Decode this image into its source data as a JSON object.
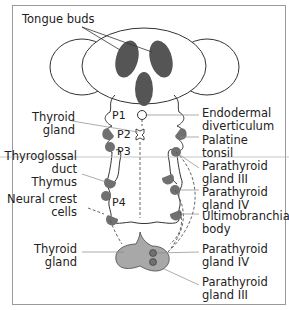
{
  "diagram": {
    "title_label": "Tongue buds",
    "pouches": [
      "P1",
      "P2",
      "P3",
      "P4"
    ],
    "left_labels": [
      {
        "lines": [
          "Thyroid",
          "gland"
        ]
      },
      {
        "lines": [
          "Thyroglossal",
          "duct"
        ]
      },
      {
        "lines": [
          "Thymus"
        ]
      },
      {
        "lines": [
          "Neural crest",
          "cells"
        ]
      },
      {
        "lines": [
          "Thyroid",
          "gland"
        ]
      }
    ],
    "right_labels": [
      {
        "lines": [
          "Endodermal",
          "diverticulum"
        ]
      },
      {
        "lines": [
          "Palatine",
          "tonsil"
        ]
      },
      {
        "lines": [
          "Parathyroid",
          "gland III"
        ]
      },
      {
        "lines": [
          "Parathyroid",
          "gland IV"
        ]
      },
      {
        "lines": [
          "Ultimobranchial",
          "body"
        ]
      },
      {
        "lines": [
          "Parathyroid",
          "gland IV"
        ]
      },
      {
        "lines": [
          "Parathyroid",
          "gland III"
        ]
      }
    ],
    "colors": {
      "tongue_bud": "#555555",
      "gland": "#707070",
      "thyroid": "#a8a8a8",
      "line": "#333333",
      "leader": "#888888",
      "frame": "#9a9a9a"
    }
  }
}
